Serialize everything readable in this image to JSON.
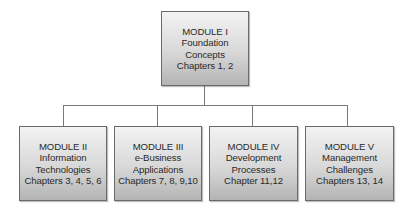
{
  "diagram": {
    "root": {
      "module": "MODULE I",
      "title_lines": [
        "Foundation",
        "Concepts"
      ],
      "chapters": "Chapters 1, 2"
    },
    "children": [
      {
        "module": "MODULE II",
        "title_lines": [
          "Information",
          "Technologies"
        ],
        "chapters": "Chapters 3, 4, 5, 6"
      },
      {
        "module": "MODULE III",
        "title_lines": [
          "e-Business",
          "Applications"
        ],
        "chapters": "Chapters 7, 8, 9,10"
      },
      {
        "module": "MODULE IV",
        "title_lines": [
          "Development",
          "Processes"
        ],
        "chapters": "Chapter 11,12"
      },
      {
        "module": "MODULE V",
        "title_lines": [
          "Management",
          "Challenges"
        ],
        "chapters": "Chapters 13, 14"
      }
    ],
    "colors": {
      "box_top": "#f3f3f3",
      "box_bottom": "#b4b4b4",
      "border": "#6a6a6a",
      "connector": "#7a7a7a",
      "text": "#2a2a2a"
    }
  }
}
